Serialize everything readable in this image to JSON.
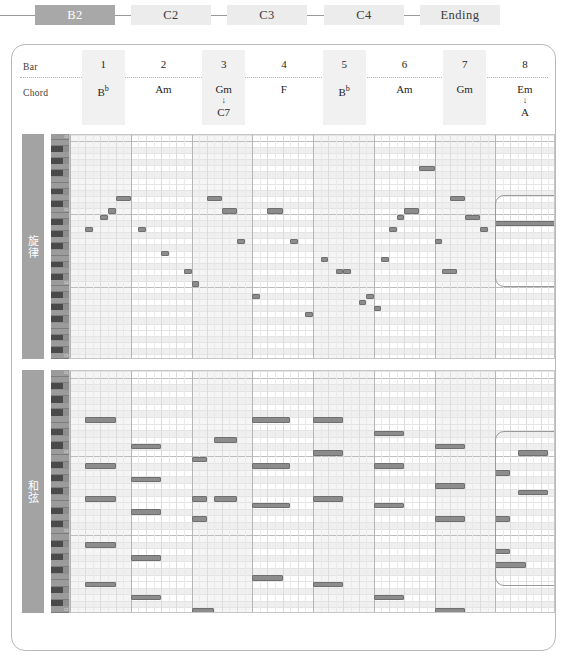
{
  "section_flow": {
    "items": [
      {
        "label": "B2",
        "active": true
      },
      {
        "label": "C2",
        "active": false
      },
      {
        "label": "C3",
        "active": false
      },
      {
        "label": "C4",
        "active": false
      },
      {
        "label": "Ending",
        "active": false
      }
    ]
  },
  "header": {
    "bar_row_label": "Bar",
    "chord_row_label": "Chord",
    "bars": [
      {
        "num": "1",
        "chord": "B",
        "chord_sup": "b",
        "alt": "",
        "arrow": ""
      },
      {
        "num": "2",
        "chord": "Am",
        "chord_sup": "",
        "alt": "",
        "arrow": ""
      },
      {
        "num": "3",
        "chord": "Gm",
        "chord_sup": "",
        "alt": "C7",
        "arrow": "↓"
      },
      {
        "num": "4",
        "chord": "F",
        "chord_sup": "",
        "alt": "",
        "arrow": ""
      },
      {
        "num": "5",
        "chord": "B",
        "chord_sup": "b",
        "alt": "",
        "arrow": ""
      },
      {
        "num": "6",
        "chord": "Am",
        "chord_sup": "",
        "alt": "",
        "arrow": ""
      },
      {
        "num": "7",
        "chord": "Gm",
        "chord_sup": "",
        "alt": "",
        "arrow": ""
      },
      {
        "num": "8",
        "chord": "Em",
        "chord_sup": "",
        "alt": "A",
        "arrow": "↓"
      }
    ]
  },
  "melody_track": {
    "label": "旋律",
    "key_labels": [
      "C6",
      "C5",
      "C4",
      "C3"
    ]
  },
  "chord_track": {
    "label": "和弦",
    "key_labels": [
      "C5",
      "C4",
      "C3",
      "C2"
    ]
  },
  "colors": {
    "note_fill": "#8c8c8c",
    "note_stroke": "#6f6f6f",
    "active_chip": "#a8a8a8",
    "inactive_chip": "#ececec",
    "side_label": "#a3a3a3",
    "keyboard": "#8e8e8e",
    "highlight_border": "#9a9a9a"
  },
  "chart_data": {
    "type": "piano-roll",
    "xlabel": "Bar",
    "ylabel": "Pitch",
    "bars": 8,
    "ticks_per_bar": 8,
    "tracks": [
      {
        "name": "旋律",
        "pitch_range": [
          48,
          84
        ],
        "notes": [
          {
            "bar": 1,
            "tick": 2,
            "pitch": 69,
            "dur": 1
          },
          {
            "bar": 1,
            "tick": 4,
            "pitch": 71,
            "dur": 1
          },
          {
            "bar": 1,
            "tick": 5,
            "pitch": 72,
            "dur": 1
          },
          {
            "bar": 1,
            "tick": 6,
            "pitch": 74,
            "dur": 2
          },
          {
            "bar": 2,
            "tick": 1,
            "pitch": 69,
            "dur": 1
          },
          {
            "bar": 2,
            "tick": 4,
            "pitch": 65,
            "dur": 1
          },
          {
            "bar": 2,
            "tick": 7,
            "pitch": 62,
            "dur": 1
          },
          {
            "bar": 3,
            "tick": 0,
            "pitch": 60,
            "dur": 1
          },
          {
            "bar": 3,
            "tick": 2,
            "pitch": 74,
            "dur": 2
          },
          {
            "bar": 3,
            "tick": 4,
            "pitch": 72,
            "dur": 2
          },
          {
            "bar": 3,
            "tick": 6,
            "pitch": 67,
            "dur": 1
          },
          {
            "bar": 4,
            "tick": 0,
            "pitch": 58,
            "dur": 1
          },
          {
            "bar": 4,
            "tick": 2,
            "pitch": 72,
            "dur": 2
          },
          {
            "bar": 4,
            "tick": 5,
            "pitch": 67,
            "dur": 1
          },
          {
            "bar": 4,
            "tick": 7,
            "pitch": 55,
            "dur": 1
          },
          {
            "bar": 5,
            "tick": 1,
            "pitch": 64,
            "dur": 1
          },
          {
            "bar": 5,
            "tick": 3,
            "pitch": 62,
            "dur": 1
          },
          {
            "bar": 5,
            "tick": 4,
            "pitch": 62,
            "dur": 1
          },
          {
            "bar": 5,
            "tick": 6,
            "pitch": 57,
            "dur": 1
          },
          {
            "bar": 5,
            "tick": 7,
            "pitch": 58,
            "dur": 1
          },
          {
            "bar": 6,
            "tick": 0,
            "pitch": 56,
            "dur": 1
          },
          {
            "bar": 6,
            "tick": 1,
            "pitch": 64,
            "dur": 1
          },
          {
            "bar": 6,
            "tick": 2,
            "pitch": 69,
            "dur": 1
          },
          {
            "bar": 6,
            "tick": 3,
            "pitch": 71,
            "dur": 1
          },
          {
            "bar": 6,
            "tick": 4,
            "pitch": 72,
            "dur": 2
          },
          {
            "bar": 6,
            "tick": 6,
            "pitch": 79,
            "dur": 2
          },
          {
            "bar": 7,
            "tick": 0,
            "pitch": 67,
            "dur": 1
          },
          {
            "bar": 7,
            "tick": 1,
            "pitch": 62,
            "dur": 2
          },
          {
            "bar": 7,
            "tick": 2,
            "pitch": 74,
            "dur": 2
          },
          {
            "bar": 7,
            "tick": 4,
            "pitch": 71,
            "dur": 2
          },
          {
            "bar": 7,
            "tick": 6,
            "pitch": 69,
            "dur": 1
          },
          {
            "bar": 8,
            "tick": 0,
            "pitch": 70,
            "dur": 8
          }
        ]
      },
      {
        "name": "和弦",
        "pitch_range": [
          36,
          72
        ],
        "notes": [
          {
            "bar": 1,
            "tick": 2,
            "pitch": 65,
            "dur": 4
          },
          {
            "bar": 1,
            "tick": 2,
            "pitch": 58,
            "dur": 4
          },
          {
            "bar": 1,
            "tick": 2,
            "pitch": 53,
            "dur": 4
          },
          {
            "bar": 1,
            "tick": 2,
            "pitch": 46,
            "dur": 4
          },
          {
            "bar": 2,
            "tick": 0,
            "pitch": 61,
            "dur": 4
          },
          {
            "bar": 2,
            "tick": 0,
            "pitch": 56,
            "dur": 4
          },
          {
            "bar": 2,
            "tick": 0,
            "pitch": 51,
            "dur": 4
          },
          {
            "bar": 2,
            "tick": 0,
            "pitch": 44,
            "dur": 4
          },
          {
            "bar": 3,
            "tick": 0,
            "pitch": 59,
            "dur": 2
          },
          {
            "bar": 3,
            "tick": 0,
            "pitch": 53,
            "dur": 2
          },
          {
            "bar": 3,
            "tick": 0,
            "pitch": 50,
            "dur": 2
          },
          {
            "bar": 3,
            "tick": 3,
            "pitch": 62,
            "dur": 3
          },
          {
            "bar": 3,
            "tick": 3,
            "pitch": 53,
            "dur": 3
          },
          {
            "bar": 4,
            "tick": 0,
            "pitch": 65,
            "dur": 5
          },
          {
            "bar": 4,
            "tick": 0,
            "pitch": 58,
            "dur": 5
          },
          {
            "bar": 4,
            "tick": 0,
            "pitch": 52,
            "dur": 5
          },
          {
            "bar": 5,
            "tick": 0,
            "pitch": 65,
            "dur": 4
          },
          {
            "bar": 5,
            "tick": 0,
            "pitch": 60,
            "dur": 4
          },
          {
            "bar": 5,
            "tick": 0,
            "pitch": 53,
            "dur": 4
          },
          {
            "bar": 6,
            "tick": 0,
            "pitch": 63,
            "dur": 4
          },
          {
            "bar": 6,
            "tick": 0,
            "pitch": 58,
            "dur": 4
          },
          {
            "bar": 6,
            "tick": 0,
            "pitch": 52,
            "dur": 4
          },
          {
            "bar": 7,
            "tick": 0,
            "pitch": 61,
            "dur": 4
          },
          {
            "bar": 7,
            "tick": 0,
            "pitch": 55,
            "dur": 4
          },
          {
            "bar": 7,
            "tick": 0,
            "pitch": 50,
            "dur": 4
          },
          {
            "bar": 8,
            "tick": 0,
            "pitch": 57,
            "dur": 2
          },
          {
            "bar": 8,
            "tick": 0,
            "pitch": 50,
            "dur": 2
          },
          {
            "bar": 8,
            "tick": 0,
            "pitch": 45,
            "dur": 2
          },
          {
            "bar": 8,
            "tick": 3,
            "pitch": 60,
            "dur": 4
          },
          {
            "bar": 8,
            "tick": 3,
            "pitch": 54,
            "dur": 4
          },
          {
            "bar": 1,
            "tick": 2,
            "pitch": 40,
            "dur": 4
          },
          {
            "bar": 2,
            "tick": 0,
            "pitch": 38,
            "dur": 4
          },
          {
            "bar": 3,
            "tick": 0,
            "pitch": 36,
            "dur": 3
          },
          {
            "bar": 4,
            "tick": 0,
            "pitch": 41,
            "dur": 4
          },
          {
            "bar": 5,
            "tick": 0,
            "pitch": 40,
            "dur": 4
          },
          {
            "bar": 6,
            "tick": 0,
            "pitch": 38,
            "dur": 4
          },
          {
            "bar": 7,
            "tick": 0,
            "pitch": 36,
            "dur": 4
          },
          {
            "bar": 8,
            "tick": 0,
            "pitch": 43,
            "dur": 4
          }
        ]
      }
    ]
  }
}
